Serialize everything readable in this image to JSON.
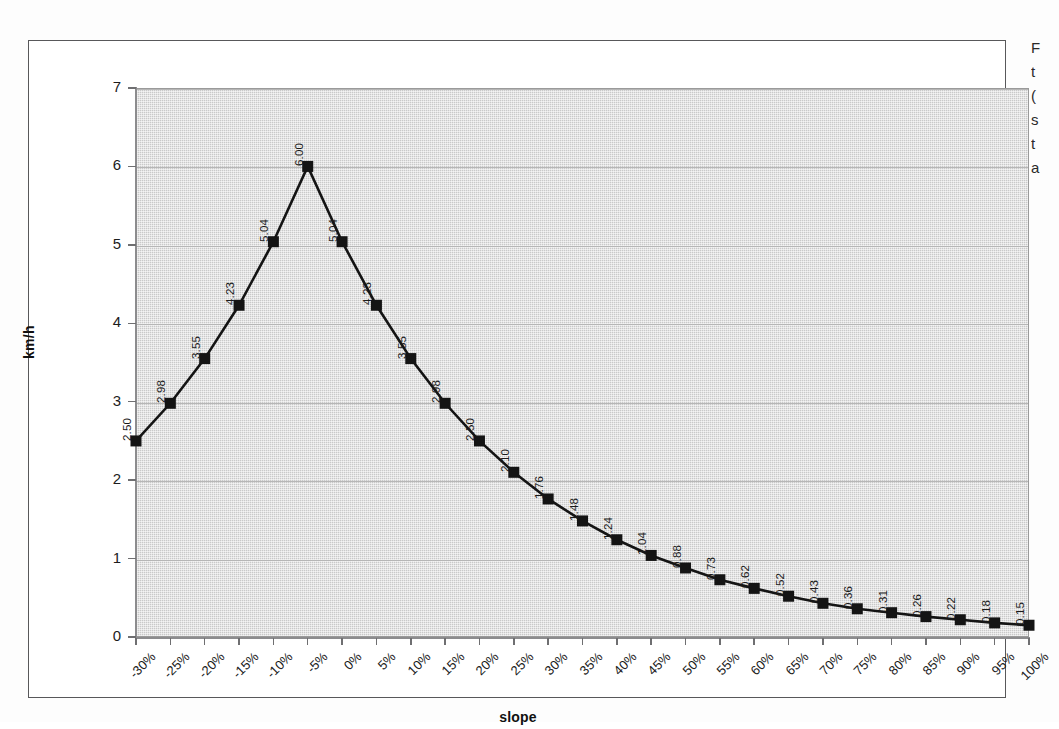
{
  "chart_data": {
    "type": "line",
    "title": "",
    "xlabel": "slope",
    "ylabel": "km/h",
    "ylim": [
      0,
      7
    ],
    "ytick_step": 1,
    "grid": true,
    "legend": "none",
    "marker": "filled-square",
    "data_labels": true,
    "categories": [
      "-30%",
      "-25%",
      "-20%",
      "-15%",
      "-10%",
      "-5%",
      "0%",
      "5%",
      "10%",
      "15%",
      "20%",
      "25%",
      "30%",
      "35%",
      "40%",
      "45%",
      "50%",
      "55%",
      "60%",
      "65%",
      "70%",
      "75%",
      "80%",
      "85%",
      "90%",
      "95%",
      "100%"
    ],
    "values": [
      2.5,
      2.98,
      3.55,
      4.23,
      5.04,
      6.0,
      5.04,
      4.23,
      3.55,
      2.98,
      2.5,
      2.1,
      1.76,
      1.48,
      1.24,
      1.04,
      0.88,
      0.73,
      0.62,
      0.52,
      0.43,
      0.36,
      0.31,
      0.26,
      0.22,
      0.18,
      0.15
    ],
    "value_labels": [
      "2.50",
      "2.98",
      "3.55",
      "4.23",
      "5.04",
      "6.00",
      "5.04",
      "4.23",
      "3.55",
      "2.98",
      "2.50",
      "2.10",
      "1.76",
      "1.48",
      "1.24",
      "1.04",
      "0.88",
      "0.73",
      "0.62",
      "0.52",
      "0.43",
      "0.36",
      "0.31",
      "0.26",
      "0.22",
      "0.18",
      "0.15"
    ],
    "ytick_labels": [
      "0",
      "1",
      "2",
      "3",
      "4",
      "5",
      "6",
      "7"
    ]
  },
  "axes": {
    "y_title": "km/h",
    "x_title": "slope"
  },
  "colors": {
    "plot_background": "#c9c9c9",
    "series_line": "#141414",
    "marker_fill": "#141414",
    "frame_border": "#58585a",
    "gridline": "#b6b6b6",
    "axis_line": "#8c8c8e",
    "text": "#1b1b1b"
  },
  "side_text": {
    "lines": [
      "F",
      "t",
      "(",
      "s",
      "t",
      "a"
    ]
  }
}
